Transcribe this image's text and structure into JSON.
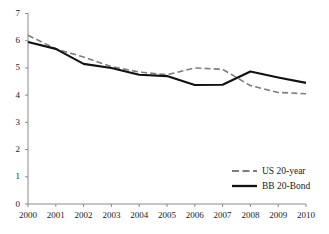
{
  "chart_data": {
    "type": "line",
    "title": "",
    "subtitle": "",
    "xlabel": "",
    "ylabel": "",
    "categories": [
      "2000",
      "2001",
      "2002",
      "2003",
      "2004",
      "2005",
      "2006",
      "2007",
      "2008",
      "2009",
      "2010"
    ],
    "x": [
      2000,
      2001,
      2002,
      2003,
      2004,
      2005,
      2006,
      2007,
      2008,
      2009,
      2010
    ],
    "xlim": [
      2000,
      2010
    ],
    "ylim": [
      0,
      7
    ],
    "yticks": [
      0,
      1,
      2,
      3,
      4,
      5,
      6,
      7
    ],
    "ytick_labels": [
      "0",
      "1",
      "2",
      "3",
      "4",
      "5",
      "6",
      "7"
    ],
    "xticks": [
      2000,
      2001,
      2002,
      2003,
      2004,
      2005,
      2006,
      2007,
      2008,
      2009,
      2010
    ],
    "grid": false,
    "legend_position": "bottom-right",
    "series": [
      {
        "name": "US 20-year",
        "style": "dashed",
        "color": "#7d7d7d",
        "values": [
          6.2,
          5.7,
          5.4,
          5.05,
          4.85,
          4.75,
          5.0,
          4.95,
          4.35,
          4.1,
          4.05
        ]
      },
      {
        "name": "BB 20-Bond",
        "style": "solid",
        "color": "#111111",
        "values": [
          5.95,
          5.7,
          5.15,
          5.0,
          4.75,
          4.7,
          4.37,
          4.38,
          4.87,
          4.65,
          4.45
        ]
      }
    ],
    "annotations": []
  },
  "axes": {
    "y_tick_labels": [
      "7",
      "6",
      "5",
      "4",
      "3",
      "2",
      "1",
      "0"
    ],
    "x_tick_labels": [
      "2000",
      "2001",
      "2002",
      "2003",
      "2004",
      "2005",
      "2006",
      "2007",
      "2008",
      "2009",
      "2010"
    ],
    "axis_color": "#8a8a8a"
  },
  "legend": {
    "items": [
      {
        "label": "US 20-year",
        "style": "dashed",
        "color": "#7d7d7d"
      },
      {
        "label": "BB 20-Bond",
        "style": "solid",
        "color": "#111111"
      }
    ]
  }
}
